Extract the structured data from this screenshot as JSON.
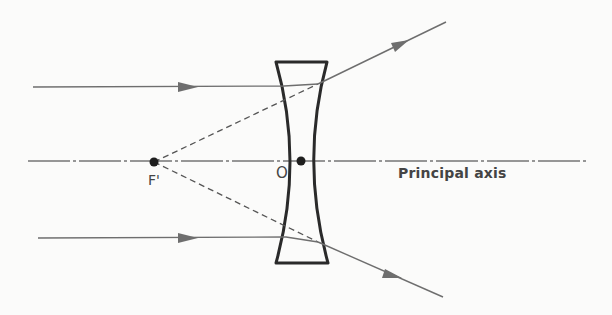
{
  "diagram": {
    "labels": {
      "focal_point": "F'",
      "optical_centre": "O",
      "principal_axis": "Principal axis"
    },
    "colors": {
      "background": "#fbfbfa",
      "ray": "#6e6e6e",
      "lens": "#2a2a2a",
      "points": "#1e1e1e",
      "text": "#444444"
    }
  }
}
